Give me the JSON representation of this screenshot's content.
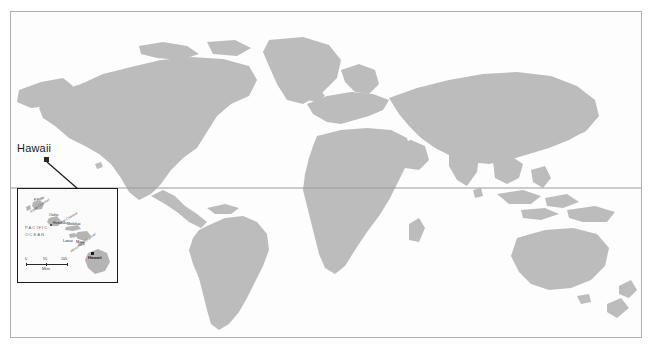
{
  "map": {
    "title": "World map with Hawaii inset",
    "land_color": "#bcbcbc",
    "ocean_color": "#fdfdfd",
    "frame_color": "#b0b0b0",
    "equator_color": "#9a9a9a",
    "equator_label": "Equator"
  },
  "callout": {
    "label": "Hawaii",
    "marker_color": "#2a2a2a",
    "leader_color": "#1a1a1a"
  },
  "inset": {
    "border_color": "#1a1a1a",
    "ocean_label_line1": "PACIFIC",
    "ocean_label_line2": "OCEAN",
    "state_label": "Hawaii",
    "islands": [
      {
        "name": "Kauai",
        "x": 17,
        "y": 13
      },
      {
        "name": "Oahu",
        "x": 31,
        "y": 29
      },
      {
        "name": "Molokai",
        "x": 50,
        "y": 39
      },
      {
        "name": "Lanai",
        "x": 45,
        "y": 47
      },
      {
        "name": "Maui",
        "x": 56,
        "y": 46
      },
      {
        "name": "Hawaii",
        "x": 72,
        "y": 62
      }
    ],
    "channels": [
      {
        "name": "Kauai Channel",
        "x": 16,
        "y": 21,
        "rot": -32
      },
      {
        "name": "Kaiwi Channel",
        "x": 40,
        "y": 34,
        "rot": -30
      },
      {
        "name": "Alenuihaha Channel",
        "x": 54,
        "y": 52,
        "rot": -34
      }
    ],
    "cities": [
      {
        "name": "Honolulu",
        "x": 33,
        "y": 34
      }
    ],
    "scale": {
      "ticks": [
        "0",
        "50",
        "100"
      ],
      "units": "Miles"
    }
  }
}
